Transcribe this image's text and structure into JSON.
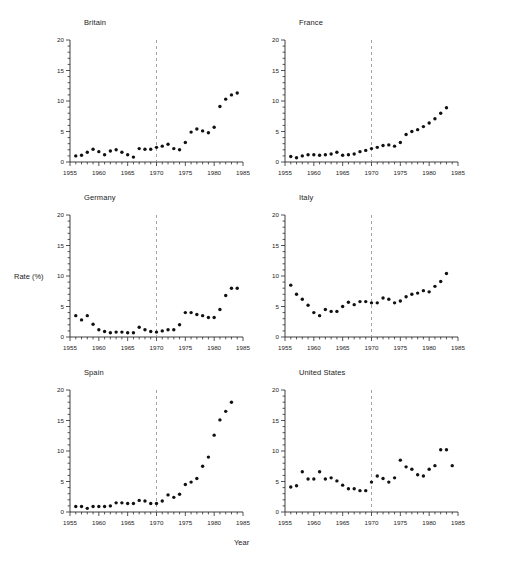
{
  "figure": {
    "xlabel": "Year",
    "ylabel": "Rate (%)",
    "marker_color": "#111111",
    "axis_color": "#2a2a2a",
    "reference_line_color": "#9a9a9a",
    "reference_line_year": 1970,
    "xlim": [
      1955,
      1985
    ],
    "ylim": [
      0,
      20
    ],
    "xticks": [
      "1955",
      "1960",
      "1965",
      "1970",
      "1975",
      "1980",
      "1985"
    ],
    "yticks": [
      "0",
      "5",
      "10",
      "15",
      "20"
    ]
  },
  "chart_data": [
    {
      "type": "scatter",
      "title": "Britain",
      "xlabel": "Year",
      "ylabel": "Rate (%)",
      "xlim": [
        1955,
        1985
      ],
      "ylim": [
        0,
        20
      ],
      "grid": false,
      "legend": "none",
      "annotations": [
        {
          "type": "vline",
          "x": 1970,
          "style": "dashed"
        }
      ],
      "x": [
        1956,
        1957,
        1958,
        1959,
        1960,
        1961,
        1962,
        1963,
        1964,
        1965,
        1966,
        1967,
        1968,
        1969,
        1970,
        1971,
        1972,
        1973,
        1974,
        1975,
        1976,
        1977,
        1978,
        1979,
        1980,
        1981,
        1982,
        1983,
        1984
      ],
      "y": [
        1.0,
        1.1,
        1.6,
        2.1,
        1.7,
        1.2,
        1.8,
        2.0,
        1.6,
        1.2,
        0.8,
        2.2,
        2.1,
        2.1,
        2.4,
        2.6,
        2.9,
        2.2,
        2.0,
        3.2,
        4.9,
        5.4,
        5.1,
        4.8,
        5.7,
        9.1,
        10.3,
        11.0,
        11.3
      ]
    },
    {
      "type": "scatter",
      "title": "France",
      "xlabel": "Year",
      "ylabel": "Rate (%)",
      "xlim": [
        1955,
        1985
      ],
      "ylim": [
        0,
        20
      ],
      "grid": false,
      "legend": "none",
      "annotations": [
        {
          "type": "vline",
          "x": 1970,
          "style": "dashed"
        }
      ],
      "x": [
        1956,
        1957,
        1958,
        1959,
        1960,
        1961,
        1962,
        1963,
        1964,
        1965,
        1966,
        1967,
        1968,
        1969,
        1970,
        1971,
        1972,
        1973,
        1974,
        1975,
        1976,
        1977,
        1978,
        1979,
        1980,
        1981,
        1982,
        1983
      ],
      "y": [
        0.9,
        0.7,
        1.0,
        1.2,
        1.2,
        1.1,
        1.2,
        1.3,
        1.6,
        1.1,
        1.2,
        1.3,
        1.7,
        1.9,
        2.2,
        2.4,
        2.7,
        2.8,
        2.6,
        3.2,
        4.5,
        5.0,
        5.3,
        5.8,
        6.4,
        7.1,
        8.0,
        8.9
      ]
    },
    {
      "type": "scatter",
      "title": "Germany",
      "xlabel": "Year",
      "ylabel": "Rate (%)",
      "xlim": [
        1955,
        1985
      ],
      "ylim": [
        0,
        20
      ],
      "grid": false,
      "legend": "none",
      "annotations": [
        {
          "type": "vline",
          "x": 1970,
          "style": "dashed"
        }
      ],
      "x": [
        1956,
        1957,
        1958,
        1959,
        1960,
        1961,
        1962,
        1963,
        1964,
        1965,
        1966,
        1967,
        1968,
        1969,
        1970,
        1971,
        1972,
        1973,
        1974,
        1975,
        1976,
        1977,
        1978,
        1979,
        1980,
        1981,
        1982,
        1983,
        1984
      ],
      "y": [
        3.5,
        2.8,
        3.5,
        2.1,
        1.2,
        0.9,
        0.7,
        0.8,
        0.8,
        0.7,
        0.7,
        1.6,
        1.2,
        0.9,
        0.8,
        1.0,
        1.2,
        1.2,
        2.0,
        4.0,
        4.0,
        3.7,
        3.5,
        3.2,
        3.2,
        4.5,
        6.8,
        8.0,
        8.0
      ]
    },
    {
      "type": "scatter",
      "title": "Italy",
      "xlabel": "Year",
      "ylabel": "Rate (%)",
      "xlim": [
        1955,
        1985
      ],
      "ylim": [
        0,
        20
      ],
      "grid": false,
      "legend": "none",
      "annotations": [
        {
          "type": "vline",
          "x": 1970,
          "style": "dashed"
        }
      ],
      "x": [
        1956,
        1957,
        1958,
        1959,
        1960,
        1961,
        1962,
        1963,
        1964,
        1965,
        1966,
        1967,
        1968,
        1969,
        1970,
        1971,
        1972,
        1973,
        1974,
        1975,
        1976,
        1977,
        1978,
        1979,
        1980,
        1981,
        1982,
        1983
      ],
      "y": [
        8.5,
        7.0,
        6.2,
        5.2,
        4.0,
        3.5,
        4.5,
        4.2,
        4.2,
        5.0,
        5.7,
        5.3,
        5.8,
        5.8,
        5.6,
        5.6,
        6.4,
        6.2,
        5.6,
        5.9,
        6.6,
        7.0,
        7.2,
        7.6,
        7.4,
        8.3,
        9.1,
        10.4
      ]
    },
    {
      "type": "scatter",
      "title": "Spain",
      "xlabel": "Year",
      "ylabel": "Rate (%)",
      "xlim": [
        1955,
        1985
      ],
      "ylim": [
        0,
        20
      ],
      "grid": false,
      "legend": "none",
      "annotations": [
        {
          "type": "vline",
          "x": 1970,
          "style": "dashed"
        }
      ],
      "x": [
        1956,
        1957,
        1958,
        1959,
        1960,
        1961,
        1962,
        1963,
        1964,
        1965,
        1966,
        1967,
        1968,
        1969,
        1970,
        1971,
        1972,
        1973,
        1974,
        1975,
        1976,
        1977,
        1978,
        1979,
        1980,
        1981,
        1982,
        1983
      ],
      "y": [
        0.9,
        0.9,
        0.6,
        0.9,
        0.9,
        0.9,
        1.0,
        1.5,
        1.5,
        1.4,
        1.4,
        1.9,
        1.8,
        1.4,
        1.4,
        1.8,
        2.8,
        2.4,
        2.9,
        4.5,
        4.9,
        5.5,
        7.5,
        9.0,
        12.6,
        15.1,
        16.5,
        18.0
      ]
    },
    {
      "type": "scatter",
      "title": "United States",
      "xlabel": "Year",
      "ylabel": "Rate (%)",
      "xlim": [
        1955,
        1985
      ],
      "ylim": [
        0,
        20
      ],
      "grid": false,
      "legend": "none",
      "annotations": [
        {
          "type": "vline",
          "x": 1970,
          "style": "dashed"
        }
      ],
      "x": [
        1956,
        1957,
        1958,
        1959,
        1960,
        1961,
        1962,
        1963,
        1964,
        1965,
        1966,
        1967,
        1968,
        1969,
        1970,
        1971,
        1972,
        1973,
        1974,
        1975,
        1976,
        1977,
        1978,
        1979,
        1980,
        1981,
        1982,
        1983,
        1984
      ],
      "y": [
        4.1,
        4.3,
        6.6,
        5.4,
        5.4,
        6.6,
        5.4,
        5.6,
        5.1,
        4.4,
        3.8,
        3.8,
        3.5,
        3.5,
        4.9,
        5.9,
        5.5,
        4.9,
        5.6,
        8.5,
        7.4,
        7.0,
        6.1,
        5.9,
        7.0,
        7.6,
        10.2,
        10.2,
        7.6
      ]
    }
  ]
}
